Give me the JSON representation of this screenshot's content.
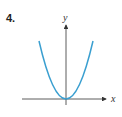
{
  "problem_number": "4.",
  "axes": {
    "x_label": "x",
    "y_label": "y"
  },
  "curve": {
    "type": "parabola",
    "description": "upward-opening parabola with vertex at origin",
    "color": "#3a9fd0"
  },
  "colors": {
    "axis": "#333333",
    "curve": "#3a9fd0"
  }
}
